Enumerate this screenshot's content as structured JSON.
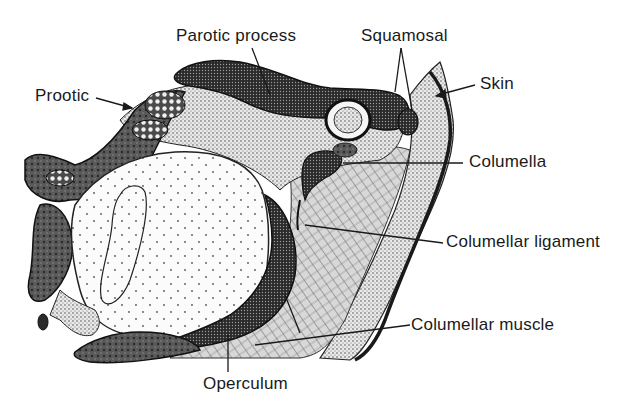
{
  "figure": {
    "labels": {
      "parotic_process": "Parotic process",
      "squamosal": "Squamosal",
      "prootic": "Prootic",
      "skin": "Skin",
      "columella": "Columella",
      "columellar_ligament": "Columellar ligament",
      "columellar_muscle": "Columellar muscle",
      "operculum": "Operculum"
    }
  }
}
